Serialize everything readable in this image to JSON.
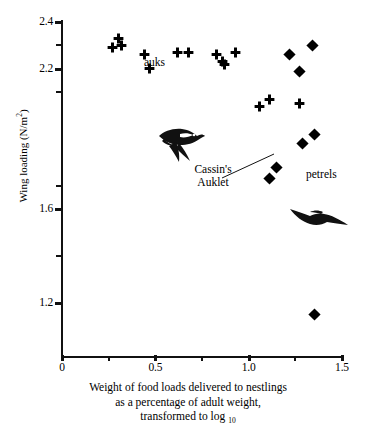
{
  "chart_data": {
    "type": "scatter",
    "title": "",
    "xlabel": "Weight of food loads delivered to nestlings as a percentage of adult weight, transformed to log 10",
    "ylabel": "Wing loading (N/m2)",
    "xlim": [
      -0.08,
      1.58
    ],
    "ylim": [
      1.03,
      2.44
    ],
    "grid": false,
    "legend_position": "in-plot annotations",
    "x_ticks_major": [
      "0",
      "0.5",
      "1.0",
      "1.5"
    ],
    "x_tick_values_major": [
      0,
      0.5,
      1.0,
      1.5
    ],
    "x_tick_values_minor": [
      0.25,
      0.75,
      1.25
    ],
    "y_ticks_major": [
      "2.4",
      "2.2",
      "1.6",
      "1.2"
    ],
    "y_tick_values_major": [
      2.4,
      2.2,
      1.6,
      1.2
    ],
    "y_tick_values_minor": [
      2.3,
      2.1,
      1.7,
      1.4
    ],
    "series": [
      {
        "name": "auks",
        "marker": "plus",
        "color": "#000000",
        "points": [
          [
            0.3,
            2.33
          ],
          [
            0.27,
            2.29
          ],
          [
            0.32,
            2.3
          ],
          [
            0.44,
            2.26
          ],
          [
            0.62,
            2.27
          ],
          [
            0.68,
            2.27
          ],
          [
            0.47,
            2.2
          ],
          [
            0.83,
            2.26
          ],
          [
            0.93,
            2.27
          ],
          [
            0.86,
            2.23
          ],
          [
            0.87,
            2.22
          ],
          [
            1.06,
            2.04
          ],
          [
            1.11,
            2.07
          ],
          [
            1.27,
            2.05
          ]
        ]
      },
      {
        "name": "petrels",
        "marker": "diamond",
        "color": "#000000",
        "points": [
          [
            1.34,
            2.3
          ],
          [
            1.22,
            2.26
          ],
          [
            1.27,
            2.19
          ],
          [
            1.35,
            1.92
          ],
          [
            1.29,
            1.88
          ],
          [
            1.15,
            1.78
          ],
          [
            1.11,
            1.73
          ],
          [
            1.35,
            1.15
          ]
        ]
      }
    ],
    "annotations": [
      {
        "text": "auks",
        "x": 0.53,
        "y": 2.31,
        "name": "auks-group-label"
      },
      {
        "text": "petrels",
        "x": 1.33,
        "y": 1.8,
        "name": "petrels-group-label"
      },
      {
        "text": "Cassin's Auklet",
        "x": 0.97,
        "y": 1.83,
        "points_to_x": 1.27,
        "points_to_y": 2.05,
        "name": "cassins-auklet-callout"
      }
    ],
    "illustrations": [
      {
        "name": "auklet-bird-illustration",
        "x": 0.62,
        "y": 2.12
      },
      {
        "name": "petrel-bird-illustration",
        "x": 1.28,
        "y": 1.53
      }
    ]
  },
  "axes": {
    "y_title_main": "Wing loading  (N/m",
    "y_title_sup": "2",
    "y_title_close": ")",
    "y_labels": [
      "2.4",
      "2.2",
      "1.6",
      "1.2"
    ],
    "x_labels": [
      "0",
      "0.5",
      "1.0",
      "1.5"
    ]
  },
  "caption": {
    "line1": "Weight of food loads delivered to nestlings",
    "line2": "as a percentage of adult weight,",
    "line3_main": "transformed to log",
    "line3_sub": "10"
  },
  "labels": {
    "auks": "auks",
    "petrels": "petrels",
    "cassins_line1": "Cassin's",
    "cassins_line2": "Auklet"
  },
  "style": {
    "ink": "#000000",
    "axis": "#111111",
    "background": "#ffffff"
  }
}
